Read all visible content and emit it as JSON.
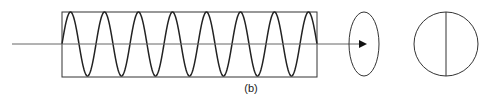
{
  "figure": {
    "caption": "(b)",
    "stroke_color": "#222222",
    "axis_color": "#555555",
    "box": {
      "x": 62,
      "y": 12,
      "width": 255,
      "height": 65
    },
    "wave": {
      "start_x": 62,
      "end_x": 317,
      "mid_y": 44,
      "amplitude": 32,
      "period": 34,
      "cycles": 7.5
    },
    "axis": {
      "x1": 12,
      "x2": 365,
      "y": 44
    },
    "ellipse": {
      "cx": 364,
      "cy": 44,
      "rx": 15,
      "ry": 32
    },
    "circle": {
      "cx": 446,
      "cy": 44,
      "r": 32
    }
  }
}
